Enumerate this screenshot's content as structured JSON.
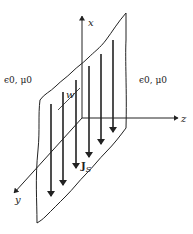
{
  "figure": {
    "type": "current sheet in free space",
    "labels": {
      "axis_x": "x",
      "axis_y": "y",
      "axis_z": "z",
      "strip_width": "w",
      "current_density": "J",
      "current_density_sub": "S",
      "medium_left": "ϵ0, μ0",
      "medium_right": "ϵ0, μ0"
    },
    "colors": {
      "ink": "#222222",
      "background": "#ffffff"
    },
    "current_arrows_count": 6
  }
}
